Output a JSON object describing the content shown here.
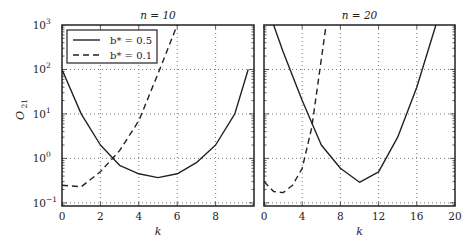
{
  "chart_data": [
    {
      "type": "line",
      "title": "n = 10",
      "xlabel": "k",
      "ylabel": "O21",
      "yscale": "log",
      "xlim": [
        0,
        10
      ],
      "ylim": [
        0.085,
        1000
      ],
      "xticks": [
        0,
        2,
        4,
        6,
        8
      ],
      "yticks": [
        "10^-1",
        "10^0",
        "10^1",
        "10^2",
        "10^3"
      ],
      "grid": true,
      "legend_position": "upper left",
      "series": [
        {
          "name": "b* = 0.5",
          "style": "solid",
          "x": [
            0,
            1,
            2,
            3,
            4,
            5,
            6,
            7,
            8,
            9,
            9.7
          ],
          "y": [
            100,
            10,
            2,
            0.7,
            0.45,
            0.37,
            0.45,
            0.8,
            2,
            10,
            100
          ]
        },
        {
          "name": "b* = 0.1",
          "style": "dashed",
          "x": [
            0,
            1,
            2,
            3,
            4,
            5,
            6
          ],
          "y": [
            0.25,
            0.23,
            0.5,
            1.5,
            7,
            80,
            1000
          ]
        }
      ]
    },
    {
      "type": "line",
      "title": "n = 20",
      "xlabel": "k",
      "ylabel": "",
      "yscale": "log",
      "xlim": [
        0,
        20
      ],
      "ylim": [
        0.085,
        1000
      ],
      "xticks": [
        0,
        4,
        8,
        12,
        16,
        20
      ],
      "grid": true,
      "series": [
        {
          "name": "b* = 0.5",
          "style": "solid",
          "x": [
            1,
            2,
            4,
            6,
            8,
            10,
            12,
            14,
            16,
            18
          ],
          "y": [
            1000,
            250,
            20,
            2,
            0.6,
            0.29,
            0.5,
            3,
            40,
            1000
          ]
        },
        {
          "name": "b* = 0.1",
          "style": "dashed",
          "x": [
            0,
            1,
            2,
            3,
            4,
            5,
            6.5
          ],
          "y": [
            0.3,
            0.18,
            0.17,
            0.25,
            0.6,
            5,
            1000
          ]
        }
      ]
    }
  ],
  "labels": {
    "left_title": "n = 10",
    "right_title": "n = 20",
    "xlabel": "k",
    "ylabel_main": "O",
    "ylabel_sub": "21",
    "legend": [
      "b* = 0.5",
      "b* = 0.1"
    ]
  }
}
